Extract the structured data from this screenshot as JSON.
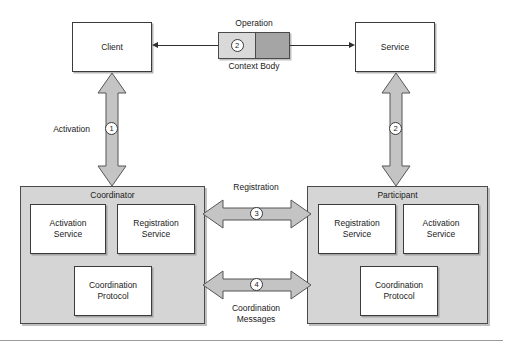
{
  "figure": {
    "kind": "block-diagram",
    "background_color": "#ffffff",
    "fill_gray": "#d5d5d5",
    "arrow_gray": "#c4c4c4",
    "context_gray": "#d9d9d9",
    "body_gray": "#a5a5a5",
    "line_color": "#2e2e2e"
  },
  "top_row": {
    "client_box": {
      "label": "Client"
    },
    "service_box": {
      "label": "Service"
    },
    "message": {
      "top_label": "Operation",
      "bottom_label": "Context Body",
      "badge": "2",
      "context_segment_label": "Context",
      "body_segment_label": "Body"
    }
  },
  "vertical_links": {
    "left": {
      "label": "Activation",
      "badge": "1"
    },
    "right": {
      "label": "",
      "badge": "2"
    }
  },
  "horizontal_links": {
    "registration": {
      "label": "Registration",
      "badge": "3",
      "label_position": "above"
    },
    "coordination": {
      "label": "Coordination\nMessages",
      "badge": "4",
      "label_position": "below"
    }
  },
  "coordinator": {
    "title": "Coordinator",
    "services": [
      {
        "line1": "Activation",
        "line2": "Service"
      },
      {
        "line1": "Registration",
        "line2": "Service"
      }
    ],
    "protocol": {
      "line1": "Coordination",
      "line2": "Protocol"
    }
  },
  "participant": {
    "title": "Participant",
    "services": [
      {
        "line1": "Registration",
        "line2": "Service"
      },
      {
        "line1": "Activation",
        "line2": "Service"
      }
    ],
    "protocol": {
      "line1": "Coordination",
      "line2": "Protocol"
    }
  }
}
